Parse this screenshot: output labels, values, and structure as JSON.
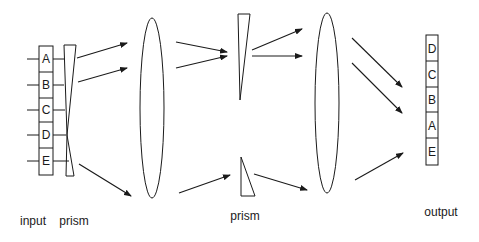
{
  "colors": {
    "stroke": "#1a1a1a",
    "background": "#ffffff"
  },
  "input": {
    "label": "input",
    "cells": [
      "A",
      "B",
      "C",
      "D",
      "E"
    ]
  },
  "input_prism": {
    "label": "prism"
  },
  "middle_prism": {
    "label": "prism"
  },
  "output": {
    "label": "output",
    "cells": [
      "D",
      "C",
      "B",
      "A",
      "E"
    ]
  },
  "elements": [
    "input column A–E",
    "wedge prism",
    "lens 1",
    "split prism (top wedge, bottom wedge)",
    "lens 2",
    "output column D,C,B,A,E"
  ]
}
